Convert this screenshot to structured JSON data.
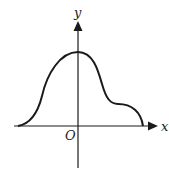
{
  "figure": {
    "type": "function-graph-sketch",
    "axes": {
      "x_label": "x",
      "y_label": "y",
      "origin_label": "O"
    },
    "curve_description": "Smooth curve starting on the negative x-axis, rising to a single maximum on the y-axis, descending to a shoulder/inflection plateau in the first quadrant, then falling to meet the positive x-axis."
  },
  "colors": {
    "stroke": "#1a1a1a",
    "background": "#ffffff"
  }
}
